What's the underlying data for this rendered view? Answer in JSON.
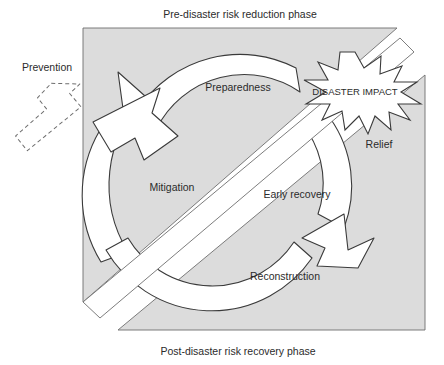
{
  "figure": {
    "colors": {
      "plane_fill": "#dcdcdc",
      "plane_stroke": "#6e6e6e",
      "ring_fill": "#ffffff",
      "ring_stroke": "#3a3a3a",
      "burst_fill": "#ffffff",
      "burst_stroke": "#3a3a3a",
      "text": "#2b2b2b",
      "dashed_stroke": "#6e6e6e",
      "background": "#ffffff"
    }
  },
  "phases": {
    "top_label": "Pre-disaster risk reduction phase",
    "bottom_label": "Post-disaster risk recovery phase"
  },
  "cycle": {
    "stages": [
      {
        "id": "mitigation",
        "label": "Mitigation",
        "x": 172,
        "y": 188
      },
      {
        "id": "preparedness",
        "label": "Preparedness",
        "x": 238,
        "y": 88
      },
      {
        "id": "relief",
        "label": "Relief",
        "x": 379,
        "y": 145
      },
      {
        "id": "early-recovery",
        "label": "Early recovery",
        "x": 297,
        "y": 195
      },
      {
        "id": "reconstruction",
        "label": "Reconstruction",
        "x": 285,
        "y": 277
      }
    ]
  },
  "impact": {
    "label": "DISASTER IMPACT",
    "x": 355,
    "y": 92
  },
  "prevention": {
    "label": "Prevention",
    "x": 47,
    "y": 68
  }
}
